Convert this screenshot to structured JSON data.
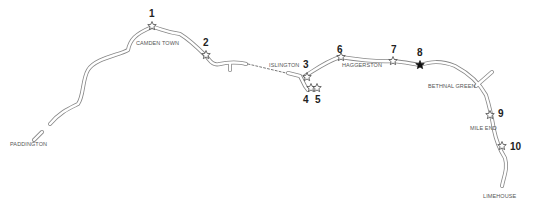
{
  "places": {
    "paddington": "PADDINGTON",
    "camden_town": "CAMDEN TOWN",
    "islington": "ISLINGTON",
    "haggerston": "HAGGERSTON",
    "bethnal_green": "BETHNAL GREEN",
    "mile_end": "MILE END",
    "limehouse": "LIMEHOUSE"
  },
  "markers": [
    {
      "number": "1",
      "style": "outline"
    },
    {
      "number": "2",
      "style": "outline"
    },
    {
      "number": "3",
      "style": "outline"
    },
    {
      "number": "4",
      "style": "outline"
    },
    {
      "number": "5",
      "style": "outline"
    },
    {
      "number": "6",
      "style": "outline"
    },
    {
      "number": "7",
      "style": "outline"
    },
    {
      "number": "8",
      "style": "filled"
    },
    {
      "number": "9",
      "style": "outline"
    },
    {
      "number": "10",
      "style": "outline"
    }
  ],
  "colors": {
    "canal": "#888888",
    "marker": "#333333",
    "marker_filled": "#111111"
  }
}
